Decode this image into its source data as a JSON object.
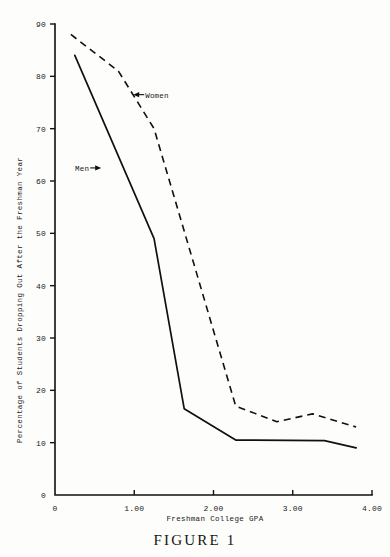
{
  "figure": {
    "caption": "FIGURE 1"
  },
  "chart_data": {
    "type": "line",
    "title": "",
    "subtitle": "",
    "xlabel": "Freshman College GPA",
    "ylabel": "Percentage of Students Dropping Out After the Freshman Year",
    "xlim": [
      0,
      4.0
    ],
    "ylim": [
      0,
      90
    ],
    "xticks": [
      0,
      1.0,
      2.0,
      3.0,
      4.0
    ],
    "xtick_labels": [
      "0",
      "1.00",
      "2.00",
      "3.00",
      "4.00"
    ],
    "yticks": [
      0,
      10,
      20,
      30,
      40,
      50,
      60,
      70,
      80,
      90
    ],
    "ytick_labels": [
      "0",
      "10",
      "20",
      "30",
      "40",
      "50",
      "60",
      "70",
      "80",
      "90"
    ],
    "grid": false,
    "legend_position": "inline-annotations",
    "line_color": "#101010",
    "series": [
      {
        "name": "Men",
        "style": "solid",
        "x": [
          0.25,
          1.25,
          1.63,
          2.28,
          3.4,
          3.8
        ],
        "values": [
          84.0,
          49.0,
          16.5,
          10.5,
          10.4,
          9.0
        ]
      },
      {
        "name": "Women",
        "style": "dashed",
        "x": [
          0.2,
          0.8,
          1.25,
          2.28,
          2.8,
          3.25,
          3.8
        ],
        "values": [
          88.0,
          81.0,
          70.0,
          17.0,
          14.0,
          15.5,
          13.0
        ]
      }
    ],
    "annotations": [
      {
        "text": "Women",
        "x": 1.05,
        "y": 76.5,
        "arrow": "left"
      },
      {
        "text": "Men",
        "x": 0.52,
        "y": 62.5,
        "arrow": "right"
      }
    ]
  }
}
